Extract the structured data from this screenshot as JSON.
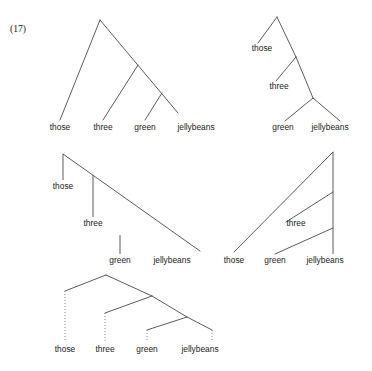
{
  "figure": {
    "example_number": "(17)",
    "width": 372,
    "height": 371,
    "ink_color": "#4a4a4a",
    "trace_color": "#7d7d7d",
    "text_color": "#1b1b1b"
  },
  "words": {
    "those": "those",
    "three": "three",
    "green": "green",
    "jellybeans": "jellybeans"
  },
  "trees": [
    {
      "id": "tree-1",
      "name": "right-branching-flat-baseline",
      "description": "Right-branching tree with all four words on one baseline",
      "labels": [
        {
          "text": "those",
          "x": 60,
          "y": 130
        },
        {
          "text": "three",
          "x": 103,
          "y": 130
        },
        {
          "text": "green",
          "x": 145,
          "y": 130
        },
        {
          "text": "jellybeans",
          "x": 196,
          "y": 130
        }
      ],
      "edges": [
        {
          "x1": 100,
          "y1": 20,
          "x2": 60,
          "y2": 120
        },
        {
          "x1": 100,
          "y1": 20,
          "x2": 178,
          "y2": 113
        },
        {
          "x1": 138,
          "y1": 65,
          "x2": 103,
          "y2": 120
        },
        {
          "x1": 162,
          "y1": 93,
          "x2": 145,
          "y2": 120
        }
      ],
      "stems": [],
      "traces": []
    },
    {
      "id": "tree-2",
      "name": "right-branching-staircase",
      "description": "Right-branching tree with those and three at stepped heights",
      "labels": [
        {
          "text": "those",
          "x": 262,
          "y": 51
        },
        {
          "text": "three",
          "x": 279,
          "y": 89
        },
        {
          "text": "green",
          "x": 283,
          "y": 130
        },
        {
          "text": "jellybeans",
          "x": 330,
          "y": 130
        }
      ],
      "edges": [
        {
          "x1": 277,
          "y1": 17,
          "x2": 258,
          "y2": 43
        },
        {
          "x1": 277,
          "y1": 17,
          "x2": 296,
          "y2": 57
        },
        {
          "x1": 296,
          "y1": 57,
          "x2": 276,
          "y2": 81
        },
        {
          "x1": 296,
          "y1": 57,
          "x2": 313,
          "y2": 98
        },
        {
          "x1": 313,
          "y1": 98,
          "x2": 285,
          "y2": 121
        },
        {
          "x1": 313,
          "y1": 98,
          "x2": 340,
          "y2": 121
        }
      ],
      "stems": [],
      "traces": []
    },
    {
      "id": "tree-3",
      "name": "descending-cascade",
      "description": "Descending cascade with vertical stems to each word",
      "labels": [
        {
          "text": "those",
          "x": 63,
          "y": 189
        },
        {
          "text": "three",
          "x": 93,
          "y": 226
        },
        {
          "text": "green",
          "x": 120,
          "y": 263
        },
        {
          "text": "jellybeans",
          "x": 172,
          "y": 263
        }
      ],
      "edges": [
        {
          "x1": 63,
          "y1": 154,
          "x2": 200,
          "y2": 251
        }
      ],
      "stems": [
        {
          "x1": 63,
          "y1": 154,
          "x2": 63,
          "y2": 180
        },
        {
          "x1": 93,
          "y1": 175,
          "x2": 93,
          "y2": 217
        },
        {
          "x1": 120,
          "y1": 235,
          "x2": 120,
          "y2": 254
        }
      ],
      "traces": []
    },
    {
      "id": "tree-4",
      "name": "left-branching-spine",
      "description": "Left-branching tree with a vertical spine above jellybeans",
      "labels": [
        {
          "text": "those",
          "x": 234,
          "y": 263
        },
        {
          "text": "green",
          "x": 275,
          "y": 263
        },
        {
          "text": "jellybeans",
          "x": 325,
          "y": 263
        }
      ],
      "edges": [
        {
          "x1": 333,
          "y1": 152,
          "x2": 234,
          "y2": 252
        },
        {
          "x1": 333,
          "y1": 192,
          "x2": 286,
          "y2": 222
        },
        {
          "x1": 333,
          "y1": 228,
          "x2": 275,
          "y2": 254
        }
      ],
      "stems": [
        {
          "x1": 333,
          "y1": 152,
          "x2": 333,
          "y2": 254
        }
      ],
      "traces": [],
      "extra_labels": [
        {
          "text": "three",
          "x": 296,
          "y": 226
        }
      ]
    },
    {
      "id": "tree-5",
      "name": "binary-tree-dotted-traces",
      "description": "Binary branching tree with dotted vertical traces to words",
      "labels": [
        {
          "text": "those",
          "x": 65,
          "y": 352
        },
        {
          "text": "three",
          "x": 105,
          "y": 352
        },
        {
          "text": "green",
          "x": 147,
          "y": 352
        },
        {
          "text": "jellybeans",
          "x": 200,
          "y": 352
        }
      ],
      "edges": [
        {
          "x1": 106,
          "y1": 275,
          "x2": 65,
          "y2": 291
        },
        {
          "x1": 106,
          "y1": 275,
          "x2": 152,
          "y2": 296
        },
        {
          "x1": 152,
          "y1": 296,
          "x2": 105,
          "y2": 313
        },
        {
          "x1": 152,
          "y1": 296,
          "x2": 187,
          "y2": 317
        },
        {
          "x1": 187,
          "y1": 317,
          "x2": 147,
          "y2": 330
        },
        {
          "x1": 187,
          "y1": 317,
          "x2": 212,
          "y2": 330
        }
      ],
      "stems": [],
      "traces": [
        {
          "x1": 65,
          "y1": 291,
          "x2": 65,
          "y2": 342
        },
        {
          "x1": 105,
          "y1": 313,
          "x2": 105,
          "y2": 342
        },
        {
          "x1": 147,
          "y1": 330,
          "x2": 147,
          "y2": 342
        },
        {
          "x1": 212,
          "y1": 330,
          "x2": 212,
          "y2": 342
        }
      ]
    }
  ]
}
